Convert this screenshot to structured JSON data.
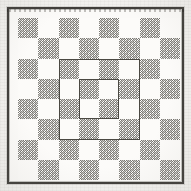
{
  "figure": {
    "width": 191,
    "height": 191,
    "medium": "halftone engraving"
  },
  "colors": {
    "paper": "#f2f1ee",
    "frame_ink": "#55534e",
    "light_square": "#fcfbf9",
    "dark_square_ink": "#8d8b85",
    "overlay_rule": "#4a4842"
  },
  "board": {
    "columns": 8,
    "rows": 8,
    "square_size_px": 20.25,
    "top_left_square": "dark",
    "squares": [
      [
        "dark",
        "light",
        "dark",
        "light",
        "dark",
        "light",
        "dark",
        "light"
      ],
      [
        "light",
        "dark",
        "light",
        "dark",
        "light",
        "dark",
        "light",
        "dark"
      ],
      [
        "dark",
        "light",
        "dark",
        "light",
        "dark",
        "light",
        "dark",
        "light"
      ],
      [
        "light",
        "dark",
        "light",
        "dark",
        "light",
        "dark",
        "light",
        "dark"
      ],
      [
        "dark",
        "light",
        "dark",
        "light",
        "dark",
        "light",
        "dark",
        "light"
      ],
      [
        "light",
        "dark",
        "light",
        "dark",
        "light",
        "dark",
        "light",
        "dark"
      ],
      [
        "dark",
        "light",
        "dark",
        "light",
        "dark",
        "light",
        "dark",
        "light"
      ],
      [
        "light",
        "dark",
        "light",
        "dark",
        "light",
        "dark",
        "light",
        "dark"
      ]
    ]
  },
  "frame": {
    "outer_rule_px": 2,
    "mat_color": "#ffffff"
  },
  "overlays": [
    {
      "name": "outer-inscribed-square",
      "spans_squares": 4,
      "left_px": 40.5,
      "top_px": 40.5,
      "width_px": 81,
      "height_px": 81
    },
    {
      "name": "inner-inscribed-square",
      "spans_squares": 2,
      "left_px": 61,
      "top_px": 61,
      "width_px": 40,
      "height_px": 40
    }
  ]
}
